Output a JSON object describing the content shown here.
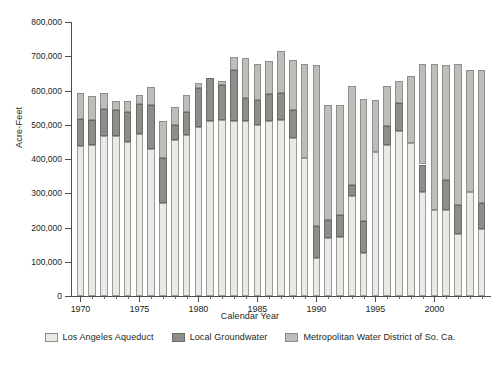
{
  "chart_data": {
    "type": "bar",
    "stacked": true,
    "title": "",
    "xlabel": "Calendar Year",
    "ylabel": "Acre-Feet",
    "ylim": [
      0,
      800000
    ],
    "ytick_step": 100000,
    "ytick_labels": [
      "800,000",
      "700,000",
      "600,000",
      "500,000",
      "400,000",
      "300,000",
      "200,000",
      "100,000",
      "0"
    ],
    "ytick_values": [
      800000,
      700000,
      600000,
      500000,
      400000,
      300000,
      200000,
      100000,
      0
    ],
    "xtick_labels": [
      "1970",
      "1975",
      "1980",
      "1985",
      "1990",
      "1995",
      "2000"
    ],
    "xtick_values": [
      1970,
      1975,
      1980,
      1985,
      1990,
      1995,
      2000
    ],
    "grid": false,
    "legend_position": "bottom",
    "categories": [
      1970,
      1971,
      1972,
      1973,
      1974,
      1975,
      1976,
      1977,
      1978,
      1979,
      1980,
      1981,
      1982,
      1983,
      1984,
      1985,
      1986,
      1987,
      1988,
      1989,
      1990,
      1991,
      1992,
      1993,
      1994,
      1995,
      1996,
      1997,
      1998,
      1999,
      2000,
      2001,
      2002,
      2003,
      2004
    ],
    "series": [
      {
        "name": "Los Angeles Aqueduct",
        "color": "#e9e9e6",
        "values": [
          438000,
          440000,
          468000,
          466000,
          451000,
          474000,
          428000,
          273000,
          455000,
          471000,
          493000,
          510000,
          514000,
          511000,
          511000,
          499000,
          510000,
          513000,
          461000,
          404000,
          110000,
          168000,
          173000,
          292000,
          127000,
          420000,
          440000,
          481000,
          446000,
          305000,
          251000,
          251000,
          181000,
          305000,
          196000
        ]
      },
      {
        "name": "Local Groundwater",
        "color": "#8d8d8a",
        "values": [
          78000,
          75000,
          78000,
          78000,
          87000,
          86000,
          130000,
          131000,
          44000,
          65000,
          113000,
          127000,
          102000,
          148000,
          66000,
          73000,
          80000,
          80000,
          81000,
          0,
          93000,
          55000,
          64000,
          31000,
          93000,
          0,
          55000,
          82000,
          0,
          79000,
          0,
          87000,
          84000,
          0,
          76000
        ]
      },
      {
        "name": "Metropolitan Water District of So. Ca.",
        "color": "#bdbdb9",
        "values": [
          76000,
          68000,
          48000,
          25000,
          32000,
          26000,
          51000,
          108000,
          54000,
          52000,
          17000,
          0,
          13000,
          38000,
          119000,
          104000,
          97000,
          122000,
          147000,
          273000,
          472000,
          335000,
          320000,
          290000,
          354000,
          152000,
          119000,
          65000,
          195000,
          293000,
          425000,
          337000,
          411000,
          354000,
          388000
        ]
      }
    ]
  },
  "legend": {
    "items": [
      {
        "label": "Los Angeles Aqueduct",
        "swatch": "swatch-aqueduct"
      },
      {
        "label": "Local Groundwater",
        "swatch": "swatch-groundwater"
      },
      {
        "label": "Metropolitan Water District of So. Ca.",
        "swatch": "swatch-mwd"
      }
    ]
  },
  "colors": {
    "aqueduct": "#e9e9e6",
    "groundwater": "#8d8d8a",
    "mwd": "#bdbdb9",
    "axis": "#4d4d4d",
    "text": "#231f20",
    "background": "#ffffff"
  }
}
